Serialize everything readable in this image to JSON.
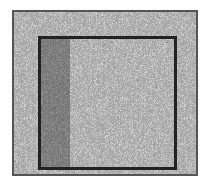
{
  "image": {
    "description": "Noise-dithered grayscale image of a framed rectangle (picture frame / window) with no legible text",
    "colors": {
      "background": "#ffffff",
      "outer_border": "#555555",
      "inner_border": "#222222",
      "noise_base": "#9a9a9a"
    }
  }
}
